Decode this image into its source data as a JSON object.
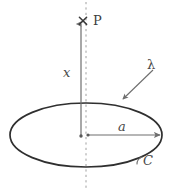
{
  "figure": {
    "kind": "physics-diagram",
    "canvas": {
      "width": 173,
      "height": 190,
      "background": "#ffffff"
    },
    "colors": {
      "ring_stroke": "#2f2f2f",
      "axis_arrow": "#6e6e6e",
      "dashed_axis": "#9a9a9a",
      "radius_arrow": "#6e6e6e",
      "leader_line": "#6e6e6e",
      "label_text": "#4a4a4a",
      "point_marker": "#3a3a3a"
    },
    "labels": {
      "point_P": "P",
      "axial_distance": "x",
      "charge_density": "λ",
      "radius": "a",
      "curve": "C"
    },
    "markers": {
      "point_P_glyph": "✕"
    },
    "geometry": {
      "ring_center": {
        "x": 86,
        "y": 135
      },
      "ring_rx": 76,
      "ring_ry": 32,
      "point_P": {
        "x": 83,
        "y": 21
      },
      "axis_arrow": {
        "x1": 81,
        "y1": 135,
        "x2": 81,
        "y2": 22
      },
      "radius_arrow": {
        "x1": 86,
        "y1": 135,
        "x2": 162,
        "y2": 135
      },
      "dashed_axis": {
        "x": 86,
        "y1": 2,
        "y2": 188
      },
      "lambda_leader": {
        "x1": 153,
        "y1": 70,
        "x2": 121,
        "y2": 101
      }
    }
  }
}
